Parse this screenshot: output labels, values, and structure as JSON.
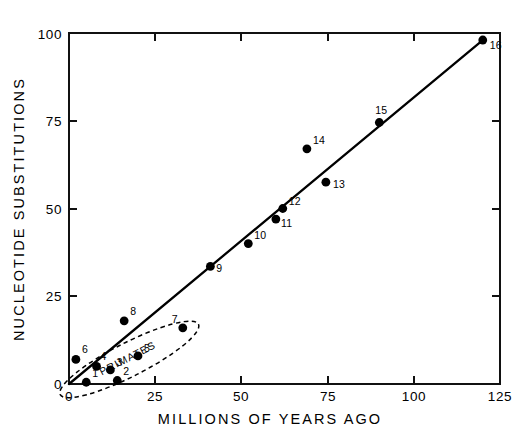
{
  "chart_data": {
    "type": "scatter",
    "title": "",
    "xlabel": "MILLIONS OF YEARS AGO",
    "ylabel": "NUCLEOTIDE SUBSTITUTIONS",
    "xlim": [
      0,
      125
    ],
    "ylim": [
      0,
      100
    ],
    "xticks": [
      0,
      25,
      50,
      75,
      100,
      125
    ],
    "yticks": [
      0,
      25,
      50,
      75,
      100
    ],
    "xticklabels": [
      "0",
      "25",
      "50",
      "75",
      "100",
      "125"
    ],
    "yticklabels": [
      "0",
      "25",
      "50",
      "75",
      "100"
    ],
    "grid": false,
    "legend": "none",
    "frame": "box",
    "tick_direction": "in",
    "series": [
      {
        "name": "taxa pairs",
        "marker": "filled-circle",
        "color": "#000000",
        "points": [
          {
            "label": "1",
            "x": 5,
            "y": 0.5,
            "lx": 6,
            "ly": -5
          },
          {
            "label": "2",
            "x": 14,
            "y": 1,
            "lx": 6,
            "ly": -5
          },
          {
            "label": "3",
            "x": 12,
            "y": 4,
            "lx": 6,
            "ly": -4
          },
          {
            "label": "4",
            "x": 8,
            "y": 5,
            "lx": 4,
            "ly": -6
          },
          {
            "label": "5",
            "x": 20,
            "y": 8,
            "lx": 6,
            "ly": -4
          },
          {
            "label": "6",
            "x": 2,
            "y": 7,
            "lx": 6,
            "ly": -6
          },
          {
            "label": "7",
            "x": 33,
            "y": 16,
            "lx": -11,
            "ly": -5
          },
          {
            "label": "8",
            "x": 16,
            "y": 18,
            "lx": 6,
            "ly": -6
          },
          {
            "label": "9",
            "x": 41,
            "y": 33.5,
            "lx": 6,
            "ly": 6
          },
          {
            "label": "10",
            "x": 52,
            "y": 40,
            "lx": 6,
            "ly": -5
          },
          {
            "label": "11",
            "x": 60,
            "y": 47,
            "lx": 5,
            "ly": 8
          },
          {
            "label": "12",
            "x": 62,
            "y": 50,
            "lx": 6,
            "ly": -4
          },
          {
            "label": "13",
            "x": 74.5,
            "y": 57.5,
            "lx": 7,
            "ly": 6
          },
          {
            "label": "14",
            "x": 69,
            "y": 67,
            "lx": 6,
            "ly": -5
          },
          {
            "label": "15",
            "x": 90,
            "y": 74.5,
            "lx": -4,
            "ly": -9
          },
          {
            "label": "16",
            "x": 120,
            "y": 98,
            "lx": 7,
            "ly": 9
          }
        ]
      }
    ],
    "fit_line": {
      "name": "regression line",
      "from": {
        "x": 0,
        "y": 0
      },
      "to": {
        "x": 120,
        "y": 98
      }
    },
    "annotations": [
      {
        "name": "primates-group",
        "label": "PRIMATES",
        "shape": "dashed-ellipse",
        "center": {
          "x": 17.5,
          "y": 7.0
        },
        "rx": 22.5,
        "ry": 4.8,
        "rotation_deg": -27,
        "label_rotation_deg": -27
      }
    ]
  },
  "axes": {
    "x_title": "MILLIONS OF YEARS AGO",
    "y_title": "NUCLEOTIDE SUBSTITUTIONS"
  }
}
